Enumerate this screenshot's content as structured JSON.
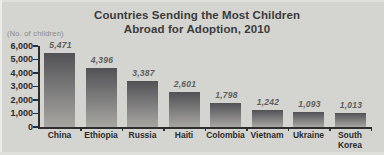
{
  "chart_data": {
    "type": "bar",
    "title": "Countries Sending the Most Children Abroad for Adoption, 2010",
    "title_lines": [
      "Countries Sending the Most Children",
      "Abroad for Adoption, 2010"
    ],
    "ylabel": "(No. of children)",
    "xlabel": "",
    "categories": [
      "China",
      "Ethiopia",
      "Russia",
      "Haiti",
      "Colombia",
      "Vietnam",
      "Ukraine",
      "South Korea"
    ],
    "categories_display": [
      "China",
      "Ethiopia",
      "Russia",
      "Haiti",
      "Colombia",
      "Vietnam",
      "Ukraine",
      "South\nKorea"
    ],
    "values": [
      5471,
      4396,
      3387,
      2601,
      1798,
      1242,
      1093,
      1013
    ],
    "value_labels": [
      "5,471",
      "4,396",
      "3,387",
      "2,601",
      "1,798",
      "1,242",
      "1,093",
      "1,013"
    ],
    "ylim": [
      0,
      6000
    ],
    "ytick_interval": 1000,
    "ytick_labels": [
      "0",
      "1,000",
      "2,000",
      "3,000",
      "4,000",
      "5,000",
      "6,000"
    ],
    "grid": false,
    "legend": "none",
    "colors": {
      "background": "#d4d4d0",
      "bar_gradient_top": "#525256",
      "bar_gradient_bottom": "#a7a6a2",
      "axis": "#2e2e2e",
      "title_text": "#3b3b3b",
      "value_label_text": "#5e5e5c",
      "unit_label_text": "#8b8b89",
      "tick_label_text": "#2b2b2b"
    }
  }
}
